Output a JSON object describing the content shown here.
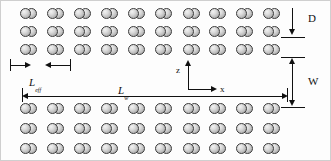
{
  "figure": {
    "type": "schematic-diagram",
    "background_color": "#fdfdfd",
    "line_color": "#111111"
  },
  "particles": {
    "shape": "dimer",
    "lobes_per_particle": 2,
    "fill_gradient_light": "#f2f2f2",
    "fill_gradient_dark": "#9a9a9a",
    "outline_color": "#3a3a3a"
  },
  "arrays": [
    {
      "id": "upper-array",
      "position": "top",
      "rows": 3,
      "columns": 10
    },
    {
      "id": "lower-array",
      "position": "bottom",
      "rows": 3,
      "columns": 10
    }
  ],
  "annotations": {
    "row_spacing": {
      "symbol": "D",
      "name": "row-spacing-label",
      "orientation": "vertical",
      "arrow": "down"
    },
    "channel_width": {
      "symbol": "W",
      "name": "channel-width-label",
      "orientation": "vertical",
      "arrow": "double-headed"
    },
    "pitch": {
      "symbol": "L",
      "subscript": "eff",
      "name": "effective-length-label",
      "orientation": "horizontal",
      "arrow": "outward-pair"
    },
    "array_length": {
      "symbol": "L",
      "subscript": "w",
      "name": "array-length-label",
      "orientation": "horizontal",
      "arrow": "double-headed"
    }
  },
  "axes": {
    "name": "coordinate-axes",
    "origin_label": "",
    "vertical": {
      "label": "z",
      "direction": "up"
    },
    "horizontal": {
      "label": "x",
      "direction": "right"
    }
  }
}
